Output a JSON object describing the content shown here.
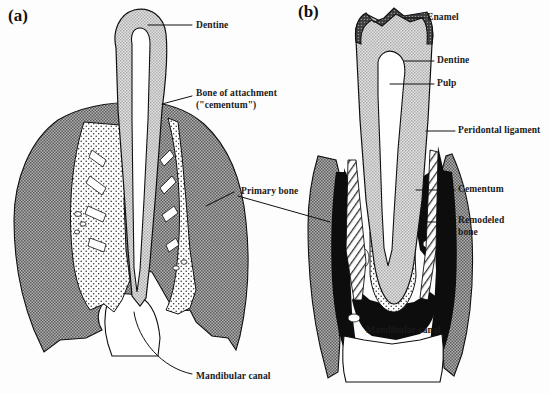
{
  "figure": {
    "background_color": "#fdfdfd",
    "panels": [
      {
        "id": "a",
        "label": "(a)",
        "x": 8,
        "y": 8
      },
      {
        "id": "b",
        "label": "(b)",
        "x": 298,
        "y": 4
      }
    ]
  },
  "colors": {
    "primary_bone": "#8c8c8c",
    "dentine": "#c9c9c9",
    "pulp": "#ffffff",
    "enamel": "#3a3a3a",
    "remodeled_bone": "#0d0d0d",
    "cementum_stipple": "#ffffff",
    "outline": "#111111",
    "label_text": "#1a1a1a"
  },
  "labels_panel_a": [
    {
      "name": "dentine",
      "text": "Dentine",
      "x": 196,
      "y": 21,
      "lines": [
        "Dentine"
      ]
    },
    {
      "name": "bone-of-attachment",
      "text": "Bone of attachment",
      "x": 196,
      "y": 91,
      "lines": [
        "Bone of attachment",
        "(\"cementum\")"
      ]
    },
    {
      "name": "primary-bone",
      "text": "Primary bone",
      "x": 241,
      "y": 186,
      "lines": [
        "Primary bone"
      ]
    },
    {
      "name": "mandibular-canal",
      "text": "Mandibular canal",
      "x": 196,
      "y": 372,
      "lines": [
        "Mandibular canal"
      ]
    }
  ],
  "labels_panel_b": [
    {
      "name": "enamel",
      "text": "Enamel",
      "x": 428,
      "y": 12,
      "lines": [
        "Enamel"
      ]
    },
    {
      "name": "dentine",
      "text": "Dentine",
      "x": 438,
      "y": 55,
      "lines": [
        "Dentine"
      ]
    },
    {
      "name": "pulp",
      "text": "Pulp",
      "x": 438,
      "y": 78,
      "lines": [
        "Pulp"
      ]
    },
    {
      "name": "peridontal-ligament",
      "text": "Peridontal ligament",
      "x": 459,
      "y": 125,
      "lines": [
        "Peridontal ligament"
      ]
    },
    {
      "name": "cementum",
      "text": "Cementum",
      "x": 459,
      "y": 184,
      "lines": [
        "Cementum"
      ]
    },
    {
      "name": "remodeled-bone",
      "text": "Remodeled bone",
      "x": 459,
      "y": 215,
      "lines": [
        "Remodeled",
        "bone"
      ]
    },
    {
      "name": "mandibular-canal",
      "text": "Mandibular canal",
      "x": 366,
      "y": 325,
      "lines": [
        "Mandibular canal"
      ]
    }
  ]
}
